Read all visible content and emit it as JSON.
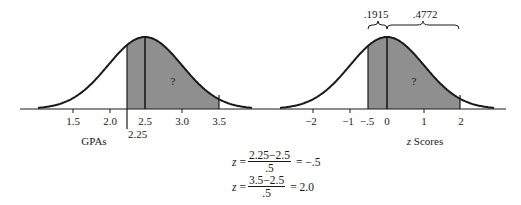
{
  "left_chart": {
    "xlabel": "GPAs",
    "ticks": [
      "1.5",
      "2.0",
      "2.5",
      "3.0",
      "3.5"
    ],
    "cut_label": "2.25",
    "shaded_region_label": "?",
    "mean": "2.5"
  },
  "right_chart": {
    "xlabel_italic": "z",
    "xlabel_rest": " Scores",
    "ticks": [
      "−2",
      "−1",
      "−.5",
      "0",
      "1",
      "2"
    ],
    "shaded_region_label": "?",
    "brace_left_label": ".1915",
    "brace_right_label": ".4772"
  },
  "equations": [
    {
      "lhs": "z",
      "num": "2.25−2.5",
      "den": ".5",
      "rhs": "= −.5"
    },
    {
      "lhs": "z",
      "num": "3.5−2.5",
      "den": ".5",
      "rhs": "= 2.0"
    }
  ],
  "colors": {
    "shade": "#8f8f8f",
    "line": "#1a1a1a"
  },
  "chart_data": [
    {
      "type": "area",
      "title": "",
      "xlabel": "GPAs",
      "ylabel": "",
      "x_ticks": [
        1.5,
        2.0,
        2.5,
        3.0,
        3.5
      ],
      "mean": 2.5,
      "sd": 0.5,
      "shaded_range": [
        2.25,
        3.5
      ],
      "annotations": [
        "2.25",
        "?"
      ]
    },
    {
      "type": "area",
      "title": "",
      "xlabel": "z Scores",
      "ylabel": "",
      "x_ticks": [
        -2,
        -1,
        -0.5,
        0,
        1,
        2
      ],
      "mean": 0,
      "sd": 1,
      "shaded_range": [
        -0.5,
        2
      ],
      "areas": [
        {
          "range": [
            -0.5,
            0
          ],
          "value": 0.1915
        },
        {
          "range": [
            0,
            2
          ],
          "value": 0.4772
        }
      ],
      "annotations": [
        ".1915",
        ".4772",
        "?"
      ]
    }
  ]
}
